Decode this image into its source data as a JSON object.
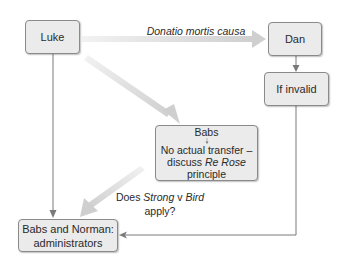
{
  "nodes": {
    "luke": "Luke",
    "dan": "Dan",
    "if_invalid": "If invalid",
    "babs": {
      "title": "Babs",
      "line1": "No actual transfer –",
      "line2_pre": "discuss ",
      "line2_italic": "Re Rose",
      "line2_post": " principle"
    },
    "administrators": {
      "line1": "Babs and Norman:",
      "line2": "administrators"
    }
  },
  "edge_labels": {
    "donatio": "Donatio mortis causa",
    "strong_v_bird": {
      "pre": "Does ",
      "italic1": "Strong",
      "mid": " v ",
      "italic2": "Bird",
      "line2": "apply?"
    }
  },
  "colors": {
    "node_fill": "#ebebeb",
    "node_border": "#8a8a8a",
    "thin_line": "#7a7a7a",
    "fat_arrow": "#d6d6d6"
  }
}
